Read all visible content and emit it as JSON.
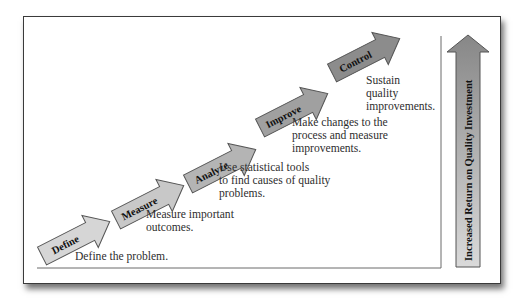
{
  "diagram": {
    "type": "staircase-process",
    "steps": [
      {
        "label": "Define",
        "description": [
          "Define the problem."
        ],
        "fill": "#d6d6d6"
      },
      {
        "label": "Measure",
        "description": [
          "Measure important",
          "outcomes."
        ],
        "fill": "#c8c8c8"
      },
      {
        "label": "Analyze",
        "description": [
          "Use statistical tools",
          "to find causes of quality",
          "problems."
        ],
        "fill": "#b4b4b4"
      },
      {
        "label": "Improve",
        "description": [
          "Make changes to the",
          "process and measure",
          "improvements."
        ],
        "fill": "#a0a0a0"
      },
      {
        "label": "Control",
        "description": [
          "Sustain",
          "quality",
          "improvements."
        ],
        "fill": "#8c8c8c"
      }
    ],
    "vertical_arrow": {
      "label": "Increased Return on Quality Investment",
      "gradient_top": "#8a8a8a",
      "gradient_bottom": "#d9d9d9"
    },
    "colors": {
      "border": "#3a3a3a",
      "text": "#2e2e2e",
      "arrow_outline": "#555555"
    }
  }
}
